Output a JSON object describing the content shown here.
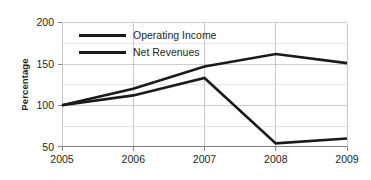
{
  "chart_data": {
    "type": "line",
    "title": "",
    "subtitle": "",
    "xlabel": "",
    "ylabel": "Percentage",
    "x": [
      2005,
      2006,
      2007,
      2008,
      2009
    ],
    "categories": [
      "2005",
      "2006",
      "2007",
      "2008",
      "2009"
    ],
    "series": [
      {
        "name": "Operating Income",
        "values": [
          100,
          112,
          133,
          54,
          60
        ],
        "color": "#1a1a1a"
      },
      {
        "name": "Net Revenues",
        "values": [
          100,
          120,
          147,
          162,
          151
        ],
        "color": "#1a1a1a"
      }
    ],
    "ylim": [
      50,
      200
    ],
    "xlim": [
      2005,
      2009
    ],
    "y_major_ticks": [
      50,
      100,
      150,
      200
    ],
    "y_major_tick_labels": [
      "50",
      "100",
      "150",
      "200"
    ],
    "y_minor_ticks": [
      75,
      125,
      175
    ],
    "x_ticks": [
      2005,
      2006,
      2007,
      2008,
      2009
    ],
    "x_tick_labels": [
      "2005",
      "2006",
      "2007",
      "2008",
      "2009"
    ],
    "grid": {
      "horizontal": true,
      "vertical": true
    },
    "legend": {
      "position": "top-left-inside",
      "entries": [
        "Operating Income",
        "Net Revenues"
      ]
    },
    "axis_color": "#7a7a7a",
    "grid_color": "#b7b7b7",
    "background_color": "#ffffff",
    "text_color": "#231f20"
  },
  "axis": {
    "y_title": "Percentage",
    "y_labels": [
      "200",
      "150",
      "100",
      "50"
    ],
    "x_labels": [
      "2005",
      "2006",
      "2007",
      "2008",
      "2009"
    ]
  },
  "legend": {
    "items": [
      {
        "label": "Operating Income"
      },
      {
        "label": "Net Revenues"
      }
    ]
  }
}
